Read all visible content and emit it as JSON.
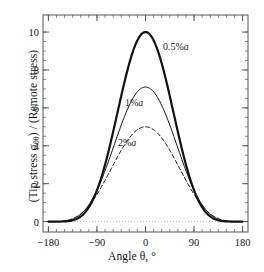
{
  "figure": {
    "background_color": "#ffffff",
    "frame_color": "#555555",
    "curve_color": "#111111",
    "zero_line_color": "#aaaaaa"
  },
  "chart_data": {
    "type": "line",
    "title": "",
    "xlabel": "Angle θ, °",
    "ylabel": "(Tip stress σθθ) / (Remote stress)",
    "xlim": [
      -190,
      190
    ],
    "ylim": [
      -0.55,
      10.9
    ],
    "xticks": [
      -180,
      -90,
      0,
      90,
      180
    ],
    "xtick_labels": [
      "−180",
      "−90",
      "0",
      "90",
      "180"
    ],
    "yticks": [
      0,
      2,
      4,
      6,
      8,
      10
    ],
    "ytick_labels": [
      "0",
      "2",
      "4",
      "6",
      "8",
      "10"
    ],
    "x_minor_tick_step": 15,
    "y_minor_tick_step": 0.5,
    "grid": false,
    "legend_position": "inline-annotations",
    "zero_reference_line": 0,
    "series": [
      {
        "name": "0.5%a",
        "label": "0.5%a",
        "style": "solid",
        "line_width": 2.2,
        "peak_value": 10.0,
        "peak_x": 0,
        "baseline": 0.0,
        "shape_exponent": 2.6,
        "label_position": {
          "x": 163,
          "y": 41
        }
      },
      {
        "name": "1%a",
        "label": "1%a",
        "style": "solid",
        "line_width": 1.0,
        "peak_value": 7.1,
        "peak_x": 0,
        "baseline": 0.0,
        "shape_exponent": 2.1,
        "label_position": {
          "x": 125,
          "y": 97
        }
      },
      {
        "name": "2%a",
        "label": "2%a",
        "style": "dashed",
        "line_width": 1.0,
        "peak_value": 5.0,
        "peak_x": 0,
        "baseline": 0.0,
        "shape_exponent": 1.8,
        "label_position": {
          "x": 118,
          "y": 137
        }
      }
    ],
    "x": [
      -180,
      -170,
      -160,
      -150,
      -140,
      -130,
      -120,
      -110,
      -100,
      -90,
      -80,
      -70,
      -60,
      -50,
      -40,
      -30,
      -20,
      -10,
      0,
      10,
      20,
      30,
      40,
      50,
      60,
      70,
      80,
      90,
      100,
      110,
      120,
      130,
      140,
      150,
      160,
      170,
      180
    ],
    "y_series": {
      "0.5%a": [
        0.0,
        0.02,
        0.07,
        0.17,
        0.35,
        0.63,
        1.05,
        1.63,
        2.38,
        3.28,
        4.3,
        5.38,
        6.45,
        7.45,
        8.32,
        9.02,
        9.53,
        9.85,
        10.0,
        9.85,
        9.53,
        9.02,
        8.32,
        7.45,
        6.45,
        5.38,
        4.3,
        3.28,
        2.38,
        1.63,
        1.05,
        0.63,
        0.35,
        0.17,
        0.07,
        0.02,
        0.0
      ],
      "1%a": [
        0.0,
        0.03,
        0.11,
        0.25,
        0.48,
        0.82,
        1.28,
        1.87,
        2.57,
        3.36,
        4.2,
        5.03,
        5.79,
        6.44,
        6.93,
        7.25,
        7.38,
        7.35,
        7.1,
        7.35,
        7.38,
        7.25,
        6.93,
        6.44,
        5.79,
        5.03,
        4.2,
        3.36,
        2.57,
        1.87,
        1.28,
        0.82,
        0.48,
        0.25,
        0.11,
        0.03,
        0.0
      ],
      "2%a": [
        0.0,
        0.03,
        0.1,
        0.23,
        0.42,
        0.7,
        1.07,
        1.53,
        2.07,
        2.66,
        3.27,
        3.85,
        4.36,
        4.75,
        4.98,
        5.05,
        5.02,
        4.99,
        4.98,
        4.99,
        5.02,
        5.05,
        4.98,
        4.75,
        4.36,
        3.85,
        3.27,
        2.66,
        2.07,
        1.53,
        1.07,
        0.7,
        0.42,
        0.23,
        0.1,
        0.03,
        0.0
      ]
    }
  }
}
